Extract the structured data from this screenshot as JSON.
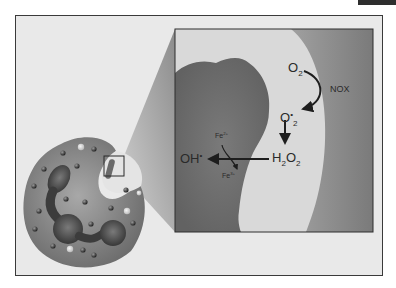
{
  "figure": {
    "labels": {
      "o2": {
        "base": "O",
        "sub": "2"
      },
      "nox": "NOX",
      "superoxide": {
        "base": "O",
        "sub": "2",
        "sup": "•"
      },
      "h2o2": {
        "h": "H",
        "h_sub": "2",
        "o": "O",
        "o_sub": "2"
      },
      "fe2": {
        "base": "Fe",
        "sup": "2+"
      },
      "fe3": {
        "base": "Fe",
        "sup": "3+"
      },
      "oh": {
        "base": "OH",
        "sup": "•"
      }
    },
    "colors": {
      "background": "#e9e9e9",
      "frame": "#3a3a3a",
      "cell_body": "#8a8a8a",
      "nucleus": "#4a4a4a",
      "bacterium": "#6e6e6e",
      "phagosome_lumen": "#dcdcdc",
      "cytoplasm_band": "#8e8e8e",
      "arrow": "#1e1e1e"
    }
  }
}
